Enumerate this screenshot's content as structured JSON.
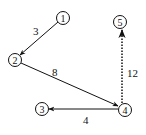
{
  "diagram": {
    "type": "directed-weighted-graph",
    "nodes": [
      {
        "id": "1",
        "label": "1",
        "x": 63,
        "y": 18
      },
      {
        "id": "2",
        "label": "2",
        "x": 15,
        "y": 60
      },
      {
        "id": "3",
        "label": "3",
        "x": 42,
        "y": 109
      },
      {
        "id": "4",
        "label": "4",
        "x": 125,
        "y": 110
      },
      {
        "id": "5",
        "label": "5",
        "x": 120,
        "y": 22
      }
    ],
    "edges": [
      {
        "from": "1",
        "to": "2",
        "weight": "3",
        "style": "solid",
        "label_x": 37,
        "label_y": 35
      },
      {
        "from": "2",
        "to": "4",
        "weight": "8",
        "style": "solid",
        "label_x": 55,
        "label_y": 77
      },
      {
        "from": "4",
        "to": "3",
        "weight": "4",
        "style": "solid",
        "label_x": 86,
        "label_y": 124
      },
      {
        "from": "4",
        "to": "5",
        "weight": "12",
        "style": "dotted",
        "label_x": 128,
        "label_y": 76
      }
    ],
    "colors": {
      "stroke": "#111111",
      "background": "#ffffff"
    }
  }
}
